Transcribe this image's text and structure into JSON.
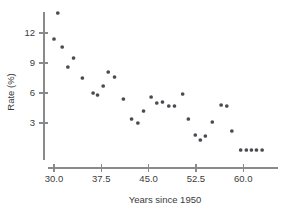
{
  "chart_data": {
    "type": "scatter",
    "title": "",
    "xlabel": "Years since 1950",
    "ylabel": "Rate (%)",
    "xlim": [
      28.5,
      64.0
    ],
    "ylim": [
      0.0,
      14.5
    ],
    "xticks": [
      30.0,
      37.5,
      45.0,
      52.5,
      60.0
    ],
    "xtick_labels": [
      "30.0",
      "37.5",
      "45.0",
      "52.5",
      "60.0"
    ],
    "yticks": [
      3,
      6,
      9,
      12
    ],
    "ytick_labels": [
      "3",
      "6",
      "9",
      "12"
    ],
    "grid": false,
    "legend": null,
    "marker": "circle",
    "marker_color": "#4a4a52",
    "axis_color": "#8a8a8a",
    "points": [
      {
        "x": 30.0,
        "y": 11.4
      },
      {
        "x": 30.6,
        "y": 14.0
      },
      {
        "x": 31.3,
        "y": 10.6
      },
      {
        "x": 32.2,
        "y": 8.6
      },
      {
        "x": 33.1,
        "y": 9.5
      },
      {
        "x": 34.5,
        "y": 7.5
      },
      {
        "x": 36.2,
        "y": 6.0
      },
      {
        "x": 36.9,
        "y": 5.8
      },
      {
        "x": 37.8,
        "y": 6.7
      },
      {
        "x": 38.6,
        "y": 8.1
      },
      {
        "x": 39.6,
        "y": 7.6
      },
      {
        "x": 41.0,
        "y": 5.4
      },
      {
        "x": 42.3,
        "y": 3.4
      },
      {
        "x": 43.3,
        "y": 3.0
      },
      {
        "x": 44.2,
        "y": 4.2
      },
      {
        "x": 45.4,
        "y": 5.6
      },
      {
        "x": 46.3,
        "y": 5.0
      },
      {
        "x": 47.2,
        "y": 5.1
      },
      {
        "x": 48.2,
        "y": 4.7
      },
      {
        "x": 49.1,
        "y": 4.7
      },
      {
        "x": 50.4,
        "y": 5.9
      },
      {
        "x": 51.3,
        "y": 3.4
      },
      {
        "x": 52.4,
        "y": 1.8
      },
      {
        "x": 53.2,
        "y": 1.3
      },
      {
        "x": 54.0,
        "y": 1.7
      },
      {
        "x": 55.1,
        "y": 3.1
      },
      {
        "x": 56.5,
        "y": 4.8
      },
      {
        "x": 57.4,
        "y": 4.7
      },
      {
        "x": 58.2,
        "y": 2.2
      },
      {
        "x": 59.6,
        "y": 0.3
      },
      {
        "x": 60.5,
        "y": 0.3
      },
      {
        "x": 61.3,
        "y": 0.3
      },
      {
        "x": 62.1,
        "y": 0.3
      },
      {
        "x": 63.0,
        "y": 0.3
      }
    ]
  }
}
